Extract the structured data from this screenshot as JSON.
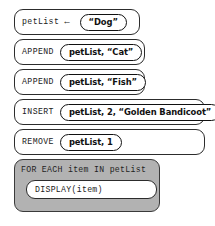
{
  "diagram": {
    "kind": "block-pseudocode",
    "colors": {
      "loop_block_fill": "#b2b2b2",
      "box_fill": "#ffffff",
      "box_border": "#2c2c2c",
      "text": "#1a1a1a"
    },
    "statements": [
      {
        "id": "assign",
        "keyword": "petList",
        "operator": "←",
        "argument": "“Dog”"
      },
      {
        "id": "append-cat",
        "keyword": "APPEND",
        "operator": "",
        "argument": "petList, “Cat”"
      },
      {
        "id": "append-fish",
        "keyword": "APPEND",
        "operator": "",
        "argument": "petList, “Fish”"
      },
      {
        "id": "insert",
        "keyword": "INSERT",
        "operator": "",
        "argument": "petList, 2, “Golden Bandicoot”"
      },
      {
        "id": "remove",
        "keyword": "REMOVE",
        "operator": "",
        "argument": "petList, 1"
      }
    ],
    "loop": {
      "header": "FOR EACH item IN petList",
      "body": "DISPLAY(item)"
    }
  }
}
